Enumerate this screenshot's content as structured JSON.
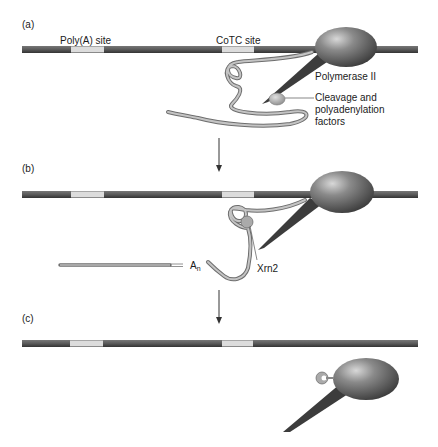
{
  "panels": [
    {
      "label": "(a)",
      "site_labels": {
        "polya": "Poly(A) site",
        "cotc": "CoTC site"
      },
      "annotations": {
        "polymerase": "Polymerase II",
        "factors_line1": "Cleavage and",
        "factors_line2": "polyadenylation",
        "factors_line3": "factors"
      }
    },
    {
      "label": "(b)",
      "annotations": {
        "polya_tail": "A",
        "polya_tail_sub": "n",
        "exonuclease": "Xrn2"
      }
    },
    {
      "label": "(c)"
    }
  ],
  "colors": {
    "dna": "#555555",
    "dna_site": "#dcdcdc",
    "polymerase_dark": "#3a3a3a",
    "polymerase_light": "#bdbdbd",
    "rna": "#9a9a9a",
    "factor": "#a8a8a8"
  }
}
